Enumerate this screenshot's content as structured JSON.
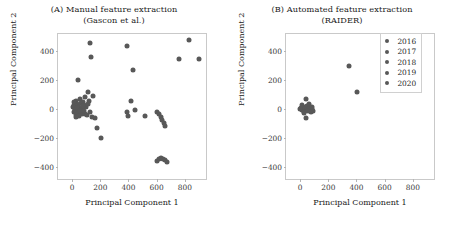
{
  "chart_data": [
    {
      "type": "scatter",
      "panel": "A",
      "title_line1": "(A) Manual feature extraction",
      "title_line2": "(Gascon et al.)",
      "xlabel": "Principal Component 1",
      "ylabel": "Principal Component 2",
      "xlim": [
        -100,
        950
      ],
      "ylim": [
        -480,
        520
      ],
      "xticks": [
        0,
        200,
        400,
        600,
        800
      ],
      "yticks": [
        -400,
        -200,
        0,
        200,
        400
      ],
      "xtick_labels": [
        "0",
        "200",
        "400",
        "600",
        "800"
      ],
      "ytick_labels": [
        "-400",
        "-200",
        "0",
        "200",
        "400"
      ],
      "grid": false,
      "marker_color": "#585858",
      "points": [
        [
          130,
          455
        ],
        [
          390,
          440
        ],
        [
          830,
          480
        ],
        [
          135,
          360
        ],
        [
          760,
          345
        ],
        [
          900,
          345
        ],
        [
          430,
          275
        ],
        [
          40,
          205
        ],
        [
          110,
          120
        ],
        [
          150,
          95
        ],
        [
          30,
          60
        ],
        [
          55,
          70
        ],
        [
          80,
          50
        ],
        [
          95,
          85
        ],
        [
          120,
          60
        ],
        [
          15,
          30
        ],
        [
          35,
          40
        ],
        [
          50,
          20
        ],
        [
          60,
          45
        ],
        [
          70,
          10
        ],
        [
          85,
          30
        ],
        [
          100,
          15
        ],
        [
          20,
          5
        ],
        [
          45,
          0
        ],
        [
          65,
          -5
        ],
        [
          10,
          -15
        ],
        [
          30,
          -20
        ],
        [
          55,
          -25
        ],
        [
          75,
          -15
        ],
        [
          90,
          -30
        ],
        [
          25,
          -40
        ],
        [
          48,
          -45
        ],
        [
          68,
          -35
        ],
        [
          105,
          -40
        ],
        [
          125,
          -20
        ],
        [
          140,
          -55
        ],
        [
          165,
          -60
        ],
        [
          5,
          15
        ],
        [
          18,
          -5
        ],
        [
          38,
          12
        ],
        [
          58,
          -12
        ],
        [
          78,
          22
        ],
        [
          12,
          48
        ],
        [
          28,
          -55
        ],
        [
          88,
          -8
        ],
        [
          112,
          35
        ],
        [
          420,
          55
        ],
        [
          390,
          -20
        ],
        [
          445,
          -5
        ],
        [
          400,
          -45
        ],
        [
          520,
          -45
        ],
        [
          600,
          -15
        ],
        [
          615,
          -35
        ],
        [
          628,
          -55
        ],
        [
          640,
          -75
        ],
        [
          652,
          -95
        ],
        [
          662,
          -115
        ],
        [
          175,
          -130
        ],
        [
          205,
          -200
        ],
        [
          600,
          -355
        ],
        [
          615,
          -340
        ],
        [
          630,
          -335
        ],
        [
          645,
          -340
        ],
        [
          660,
          -350
        ],
        [
          672,
          -365
        ]
      ]
    },
    {
      "type": "scatter",
      "panel": "B",
      "title_line1": "(B) Automated feature extraction",
      "title_line2": "(RAIDER)",
      "xlabel": "Principal Component 1",
      "ylabel": "Principal Component 2",
      "xlim": [
        -100,
        950
      ],
      "ylim": [
        -480,
        520
      ],
      "xticks": [
        0,
        200,
        400,
        600,
        800
      ],
      "yticks": [
        -400,
        -200,
        0,
        200,
        400
      ],
      "xtick_labels": [
        "0",
        "200",
        "400",
        "600",
        "800"
      ],
      "ytick_labels": [
        "-400",
        "-200",
        "0",
        "200",
        "400"
      ],
      "grid": false,
      "marker_color": "#585858",
      "points": [
        [
          350,
          300
        ],
        [
          405,
          120
        ],
        [
          40,
          75
        ],
        [
          5,
          10
        ],
        [
          20,
          20
        ],
        [
          35,
          5
        ],
        [
          50,
          25
        ],
        [
          15,
          -5
        ],
        [
          30,
          -15
        ],
        [
          45,
          15
        ],
        [
          60,
          0
        ],
        [
          70,
          20
        ],
        [
          85,
          5
        ],
        [
          95,
          -10
        ],
        [
          10,
          30
        ],
        [
          25,
          -25
        ],
        [
          55,
          -8
        ],
        [
          75,
          -20
        ],
        [
          0,
          0
        ],
        [
          65,
          35
        ],
        [
          88,
          18
        ],
        [
          45,
          -60
        ]
      ],
      "legend": {
        "position": "upper right",
        "entries": [
          {
            "label": "2016",
            "color": "#585858"
          },
          {
            "label": "2017",
            "color": "#585858"
          },
          {
            "label": "2018",
            "color": "#585858"
          },
          {
            "label": "2019",
            "color": "#585858"
          },
          {
            "label": "2020",
            "color": "#585858"
          }
        ]
      }
    }
  ]
}
